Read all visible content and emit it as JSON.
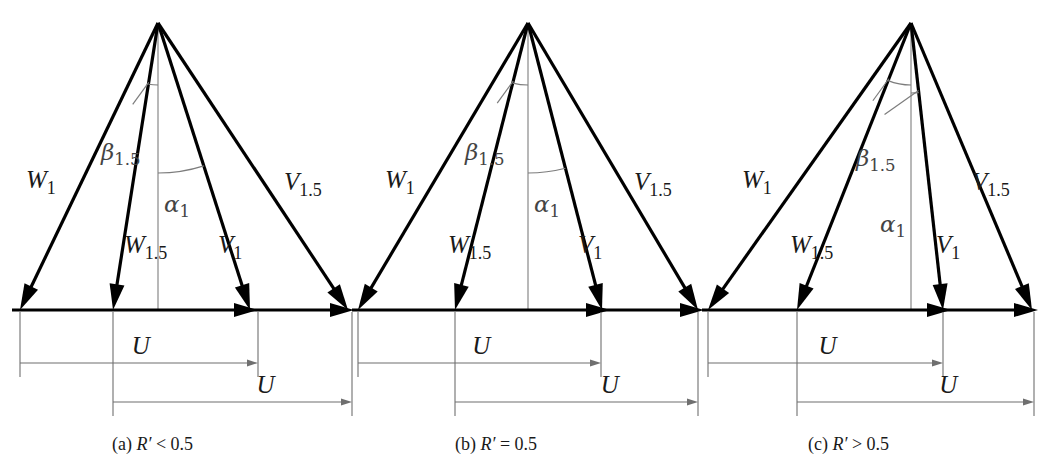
{
  "figure": {
    "type": "velocity-triangle-diagram",
    "background_color": "#ffffff",
    "line_color": "#000000",
    "dim_color": "#6f6f6f",
    "arc_color": "#7c7c7c"
  },
  "labels": {
    "W1": {
      "base": "W",
      "sub": "1"
    },
    "W15": {
      "base": "W",
      "sub": "1.5"
    },
    "V1": {
      "base": "V",
      "sub": "1"
    },
    "V15": {
      "base": "V",
      "sub": "1.5"
    },
    "beta15": {
      "base": "β",
      "sub": "1.5"
    },
    "alpha1": {
      "base": "α",
      "sub": "1"
    },
    "U": "U"
  },
  "panels": [
    {
      "id": "a",
      "caption_prefix": "(a)",
      "caption_symbol": "R′",
      "caption_relation": "<",
      "caption_value": "0.5",
      "caption_full": "(a) R′ < 0.5",
      "apex": {
        "x": 158,
        "y": 23
      },
      "baseline": {
        "x1": 12,
        "x2": 356,
        "y": 310
      },
      "tips": {
        "W1": 20,
        "W15": 113,
        "V1": 250,
        "V15": 348
      },
      "axis_x": 158,
      "dim_top": {
        "from": 20,
        "to": 258,
        "y": 363,
        "label": "U"
      },
      "dim_bottom": {
        "from": 113,
        "to": 352,
        "y": 402,
        "label": "U"
      },
      "label_pos": {
        "W1": {
          "x": 26,
          "y": 188
        },
        "W15": {
          "x": 124,
          "y": 253
        },
        "V1": {
          "x": 218,
          "y": 253
        },
        "V15": {
          "x": 284,
          "y": 190
        },
        "beta15": {
          "x": 101,
          "y": 160
        },
        "alpha1": {
          "x": 164,
          "y": 212
        }
      },
      "caption_pos": {
        "x": 112,
        "y": 434
      }
    },
    {
      "id": "b",
      "caption_prefix": "(b)",
      "caption_symbol": "R′",
      "caption_relation": "=",
      "caption_value": "0.5",
      "caption_full": "(b) R′ = 0.5",
      "apex": {
        "x": 528,
        "y": 23
      },
      "baseline": {
        "x1": 352,
        "x2": 706,
        "y": 310
      },
      "tips": {
        "W1": 358,
        "W15": 455,
        "V1": 602,
        "V15": 698
      },
      "axis_x": 528,
      "dim_top": {
        "from": 358,
        "to": 601,
        "y": 363,
        "label": "U"
      },
      "dim_bottom": {
        "from": 455,
        "to": 698,
        "y": 402,
        "label": "U"
      },
      "label_pos": {
        "W1": {
          "x": 385,
          "y": 188
        },
        "W15": {
          "x": 448,
          "y": 253
        },
        "V1": {
          "x": 578,
          "y": 253
        },
        "V15": {
          "x": 634,
          "y": 190
        },
        "beta15": {
          "x": 465,
          "y": 160
        },
        "alpha1": {
          "x": 534,
          "y": 212
        }
      },
      "caption_pos": {
        "x": 455,
        "y": 434
      }
    },
    {
      "id": "c",
      "caption_prefix": "(c)",
      "caption_symbol": "R′",
      "caption_relation": ">",
      "caption_value": "0.5",
      "caption_full": "(c) R′ > 0.5",
      "apex": {
        "x": 911,
        "y": 23
      },
      "baseline": {
        "x1": 702,
        "x2": 1040,
        "y": 310
      },
      "tips": {
        "W1": 708,
        "W15": 797,
        "V1": 943,
        "V15": 1032
      },
      "axis_x": 911,
      "dim_top": {
        "from": 708,
        "to": 943,
        "y": 363,
        "label": "U"
      },
      "dim_bottom": {
        "from": 797,
        "to": 1034,
        "y": 402,
        "label": "U"
      },
      "label_pos": {
        "W1": {
          "x": 742,
          "y": 188
        },
        "W15": {
          "x": 790,
          "y": 253
        },
        "V1": {
          "x": 936,
          "y": 253
        },
        "V15": {
          "x": 972,
          "y": 190
        },
        "beta15": {
          "x": 856,
          "y": 166
        },
        "alpha1": {
          "x": 880,
          "y": 232
        }
      },
      "caption_pos": {
        "x": 808,
        "y": 434
      }
    }
  ]
}
